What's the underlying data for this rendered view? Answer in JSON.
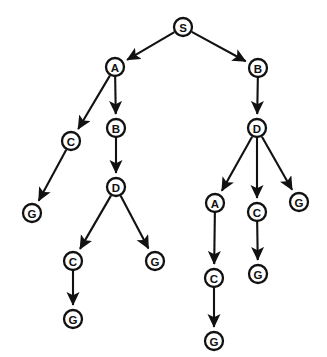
{
  "diagram": {
    "type": "search-tree",
    "title": "",
    "background_color": "#ffffff",
    "node_color": "#ffffff",
    "stroke_color": "#111111",
    "node_radius": 9,
    "canvas": {
      "width": 327,
      "height": 357
    },
    "nodes": [
      {
        "id": "n0",
        "label": "S",
        "x": 183,
        "y": 27,
        "depth": 0
      },
      {
        "id": "n1",
        "label": "A",
        "x": 115,
        "y": 67,
        "depth": 1
      },
      {
        "id": "n2",
        "label": "B",
        "x": 258,
        "y": 68,
        "depth": 1
      },
      {
        "id": "n3",
        "label": "C",
        "x": 71,
        "y": 141,
        "depth": 2
      },
      {
        "id": "n4",
        "label": "B",
        "x": 116,
        "y": 128,
        "depth": 2
      },
      {
        "id": "n5",
        "label": "D",
        "x": 257,
        "y": 128,
        "depth": 2
      },
      {
        "id": "n6",
        "label": "G",
        "x": 32,
        "y": 213,
        "depth": 3
      },
      {
        "id": "n7",
        "label": "D",
        "x": 116,
        "y": 187,
        "depth": 3
      },
      {
        "id": "n8",
        "label": "A",
        "x": 215,
        "y": 203,
        "depth": 3
      },
      {
        "id": "n9",
        "label": "C",
        "x": 257,
        "y": 212,
        "depth": 3
      },
      {
        "id": "n10",
        "label": "G",
        "x": 299,
        "y": 202,
        "depth": 3
      },
      {
        "id": "n11",
        "label": "C",
        "x": 73,
        "y": 261,
        "depth": 4
      },
      {
        "id": "n12",
        "label": "G",
        "x": 155,
        "y": 261,
        "depth": 4
      },
      {
        "id": "n13",
        "label": "C",
        "x": 214,
        "y": 278,
        "depth": 4
      },
      {
        "id": "n14",
        "label": "G",
        "x": 258,
        "y": 274,
        "depth": 4
      },
      {
        "id": "n15",
        "label": "G",
        "x": 73,
        "y": 319,
        "depth": 5
      },
      {
        "id": "n16",
        "label": "G",
        "x": 214,
        "y": 341,
        "depth": 5
      }
    ],
    "edges": [
      {
        "from": "n0",
        "to": "n1",
        "arrow": true
      },
      {
        "from": "n0",
        "to": "n2",
        "arrow": true
      },
      {
        "from": "n1",
        "to": "n3",
        "arrow": true
      },
      {
        "from": "n1",
        "to": "n4",
        "arrow": true
      },
      {
        "from": "n2",
        "to": "n5",
        "arrow": true
      },
      {
        "from": "n3",
        "to": "n6",
        "arrow": true
      },
      {
        "from": "n4",
        "to": "n7",
        "arrow": true
      },
      {
        "from": "n5",
        "to": "n8",
        "arrow": true
      },
      {
        "from": "n5",
        "to": "n9",
        "arrow": true
      },
      {
        "from": "n5",
        "to": "n10",
        "arrow": true
      },
      {
        "from": "n7",
        "to": "n11",
        "arrow": true
      },
      {
        "from": "n7",
        "to": "n12",
        "arrow": true
      },
      {
        "from": "n8",
        "to": "n13",
        "arrow": true
      },
      {
        "from": "n9",
        "to": "n14",
        "arrow": true
      },
      {
        "from": "n11",
        "to": "n15",
        "arrow": true
      },
      {
        "from": "n13",
        "to": "n16",
        "arrow": true
      }
    ]
  }
}
